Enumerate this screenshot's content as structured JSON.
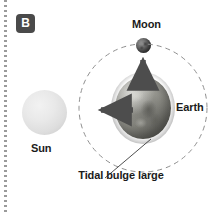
{
  "figure": {
    "panel_label": "B",
    "panel_badge_color": "#4a4a4a"
  },
  "labels": {
    "moon": "Moon",
    "earth": "Earth",
    "sun": "Sun",
    "tidal_bulge": "Tidal bulge large"
  },
  "bodies": {
    "sun": {
      "name": "Sun",
      "color": "#e4e4e4",
      "cx": 44,
      "cy": 112,
      "r": 22
    },
    "earth": {
      "name": "Earth",
      "color": "#8b8b84",
      "cx": 143,
      "cy": 108,
      "rx": 28,
      "ry": 31
    },
    "moon": {
      "name": "Moon",
      "color": "#5e5e5e",
      "cx": 143,
      "cy": 45,
      "r": 7
    }
  },
  "orbit": {
    "style": "dashed",
    "color": "#8f8f8f",
    "cx": 143,
    "cy": 108,
    "r": 64
  },
  "arrows": [
    {
      "name": "gravitational-pull-toward-sun",
      "direction": "left",
      "color": "#4d4d4d",
      "from_x": 133,
      "from_y": 110,
      "to_x": 96,
      "to_y": 110
    },
    {
      "name": "gravitational-pull-toward-moon",
      "direction": "up",
      "color": "#4d4d4d",
      "from_x": 143,
      "from_y": 82,
      "to_x": 143,
      "to_y": 55
    }
  ],
  "leader_line": {
    "name": "tidal-bulge-leader",
    "color": "#3a3a3a",
    "from_x": 105,
    "from_y": 178,
    "to_x": 150,
    "to_y": 140
  },
  "spine": {
    "color": "#9a9a9a",
    "style": "dotted"
  }
}
